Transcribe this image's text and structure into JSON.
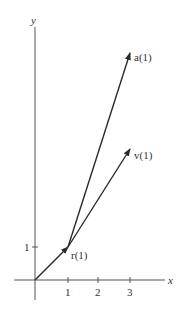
{
  "diagram": {
    "axes": {
      "x_label": "x",
      "y_label": "y",
      "x_ticks": [
        "1",
        "2",
        "3"
      ],
      "y_ticks": [
        "1"
      ]
    },
    "vectors": [
      {
        "name": "r",
        "label": "r(1)",
        "from": [
          0,
          0
        ],
        "to": [
          1,
          1
        ]
      },
      {
        "name": "v",
        "label": "v(1)",
        "from": [
          1,
          1
        ],
        "to": [
          3,
          4
        ]
      },
      {
        "name": "a",
        "label": "a(1)",
        "from": [
          1,
          1
        ],
        "to": [
          3,
          7
        ]
      }
    ],
    "colors": {
      "axis": "#555555",
      "vector": "#2a2a2a",
      "text": "#333333"
    }
  }
}
